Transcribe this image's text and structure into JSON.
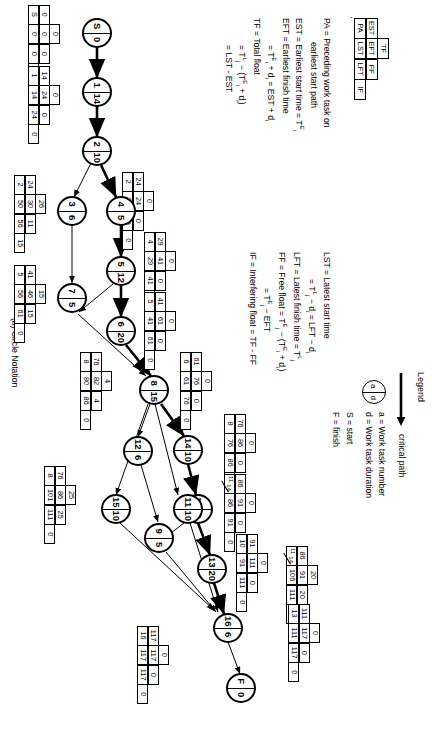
{
  "figure": {
    "caption": "(a)   Circle Notation",
    "stray_mark": "'"
  },
  "legend": {
    "title": "Legend",
    "critical_path_label": "critical path",
    "circle": {
      "top": "a",
      "bottom": "d"
    },
    "lines": [
      "a = Work task number",
      "d = Work task duration",
      "S = start",
      "F = finish"
    ]
  },
  "key_table": {
    "labels": [
      "PA",
      "EST",
      "EFT",
      "TF",
      "LST",
      "LFT",
      "FF",
      "IF"
    ],
    "rows": [
      [
        "",
        "TF"
      ],
      [
        "EST",
        "EFT",
        "FF"
      ],
      [
        "PA",
        "LST",
        "LFT",
        "IF"
      ]
    ]
  },
  "definitions_left": [
    "PA = Preceding work task on",
    "earliest start path",
    "EST = Earliest start time = T",
    "EFT = Earliest finish time",
    "= T  + d  = EST + d",
    "TF = Total float",
    "= T  - (T  + d )",
    "= LST - EST"
  ],
  "definitions_right": [
    "LST = Latest start time",
    "= T  - d  = LFT - d",
    "LFT = Latest finish time = T",
    "FF = Free float = T  - (T  + d )",
    "= T  - EFT",
    "IF = Interfering float = TF - FF"
  ],
  "nodes": [
    {
      "id": "S",
      "task": "S",
      "duration": "0"
    },
    {
      "id": "1",
      "task": "1",
      "duration": "14"
    },
    {
      "id": "2",
      "task": "2",
      "duration": "10"
    },
    {
      "id": "3",
      "task": "3",
      "duration": "6"
    },
    {
      "id": "4",
      "task": "4",
      "duration": "5"
    },
    {
      "id": "5",
      "task": "5",
      "duration": "12"
    },
    {
      "id": "6",
      "task": "6",
      "duration": "20"
    },
    {
      "id": "7",
      "task": "7",
      "duration": "5"
    },
    {
      "id": "8",
      "task": "8",
      "duration": "15"
    },
    {
      "id": "9",
      "task": "9",
      "duration": "5"
    },
    {
      "id": "10",
      "task": "10",
      "duration": "5"
    },
    {
      "id": "11",
      "task": "11",
      "duration": "10"
    },
    {
      "id": "12",
      "task": "12",
      "duration": "6"
    },
    {
      "id": "13",
      "task": "13",
      "duration": "20"
    },
    {
      "id": "14",
      "task": "14",
      "duration": "10"
    },
    {
      "id": "15",
      "task": "15",
      "duration": "10"
    },
    {
      "id": "16",
      "task": "16",
      "duration": "6"
    },
    {
      "id": "F",
      "task": "F",
      "duration": "0"
    }
  ],
  "boxes": [
    {
      "for": "S",
      "pa": "S",
      "est": "0",
      "eft": "0",
      "tf": "0",
      "lst": "0",
      "lft": "0",
      "ff": "0",
      "if": "0"
    },
    {
      "for": "1",
      "pa": "1",
      "est": "14",
      "eft": "24",
      "tf": "0",
      "lst": "14",
      "lft": "24",
      "ff": "0",
      "if": "0"
    },
    {
      "for": "2",
      "pa": "2",
      "est": "24",
      "eft": "24",
      "tf": "0",
      "lst": "29",
      "lft": "29",
      "ff": "0",
      "if": "0"
    },
    {
      "for": "3",
      "pa": "2",
      "est": "24",
      "eft": "30",
      "tf": "26",
      "lst": "50",
      "lft": "56",
      "ff": "11",
      "if": "15"
    },
    {
      "for": "4",
      "pa": "4",
      "est": "29",
      "eft": "41",
      "tf": "0",
      "lst": "29",
      "lft": "41",
      "ff": "0",
      "if": "0"
    },
    {
      "for": "5",
      "pa": "5",
      "est": "41",
      "eft": "61",
      "tf": "0",
      "lst": "41",
      "lft": "61",
      "ff": "0",
      "if": "0"
    },
    {
      "for": "7",
      "pa": "5",
      "est": "41",
      "eft": "46",
      "tf": "15",
      "lst": "56",
      "lft": "61",
      "ff": "15",
      "if": "0"
    },
    {
      "for": "8",
      "pa": "6",
      "est": "61",
      "eft": "76",
      "tf": "0",
      "lst": "61",
      "lft": "76",
      "ff": "0",
      "if": "0"
    },
    {
      "for": "12",
      "pa": "8",
      "est": "76",
      "eft": "82",
      "tf": "4",
      "lst": "80",
      "lft": "86",
      "ff": "4",
      "if": "0"
    },
    {
      "for": "14",
      "pa": "8",
      "est": "76",
      "eft": "86",
      "tf": "0",
      "lst": "76",
      "lft": "86",
      "ff": "0",
      "if": "0"
    },
    {
      "for": "15",
      "pa": "8",
      "est": "76",
      "eft": "86",
      "tf": "25",
      "lst": "101",
      "lft": "111",
      "ff": "25",
      "if": "0"
    },
    {
      "for": "10",
      "pa": "11/14",
      "est": "86",
      "eft": "91",
      "tf": "0",
      "lst": "86",
      "lft": "91",
      "ff": "0",
      "if": "0"
    },
    {
      "for": "11",
      "pa": "11/14",
      "est": "86",
      "eft": "91",
      "tf": "20",
      "lst": "106",
      "lft": "111",
      "ff": "20",
      "if": "0"
    },
    {
      "for": "13",
      "pa": "10",
      "est": "91",
      "eft": "111",
      "tf": "0",
      "lst": "91",
      "lft": "111",
      "ff": "0",
      "if": "0"
    },
    {
      "for": "16",
      "pa": "13",
      "est": "111",
      "eft": "117",
      "tf": "0",
      "lst": "111",
      "lft": "117",
      "ff": "0",
      "if": "0"
    },
    {
      "for": "F",
      "pa": "16",
      "est": "117",
      "eft": "117",
      "tf": "0",
      "lst": "117",
      "lft": "117",
      "ff": "0",
      "if": "0"
    }
  ]
}
